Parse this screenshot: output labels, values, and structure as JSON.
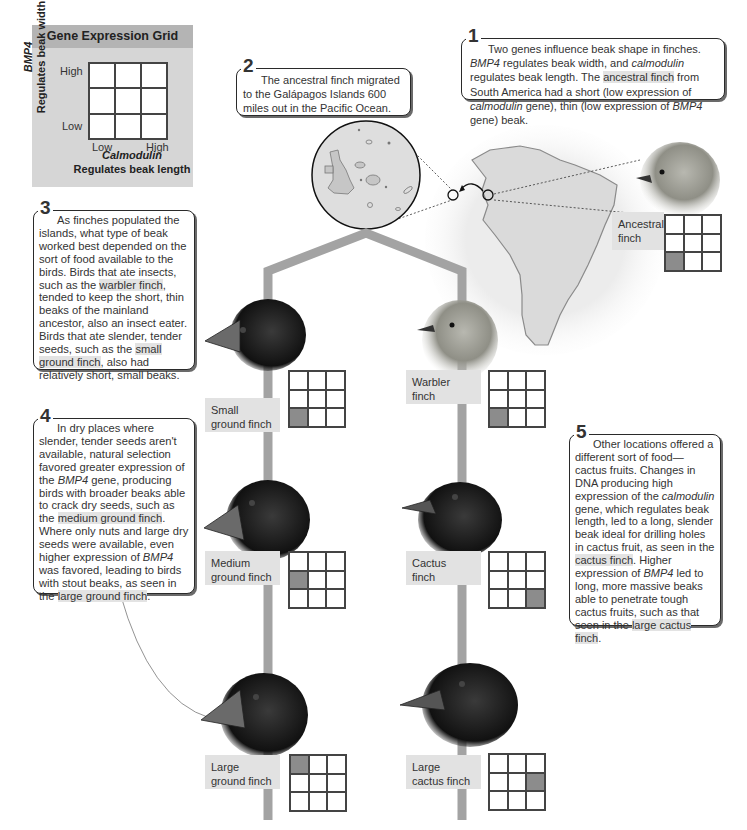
{
  "legend": {
    "title": "Gene Expression Grid",
    "y_gene": "BMP4",
    "y_desc": "Regulates beak width",
    "x_gene": "Calmodulin",
    "x_desc": "Regulates beak length",
    "y_high": "High",
    "y_low": "Low",
    "x_low": "Low",
    "x_high": "High"
  },
  "callouts": {
    "c1": {
      "num": "1",
      "t1": "Two genes influence beak shape in finches.",
      "t2a": "BMP4",
      "t2b": " regulates beak width, and ",
      "t2c": "calmodulin",
      "t2d": " regulates beak length. The ",
      "t2e": "ancestral finch",
      "t2f": " from South America had a short (low expression of ",
      "t2g": "calmodulin",
      "t2h": " gene), thin (low expression of ",
      "t2i": "BMP4",
      "t2j": " gene) beak."
    },
    "c2": {
      "num": "2",
      "text": "The ancestral finch migrated to the Galápagos Islands 600 miles out in the Pacific Ocean."
    },
    "c3": {
      "num": "3",
      "a": "As finches populated the islands, what type of beak worked best depended on the sort of food available to the birds. Birds that ate insects, such as the ",
      "b": "warbler finch",
      "c": ", tended to keep the short, thin beaks of the mainland ancestor, also an insect eater. Birds that ate slender, tender seeds, such as the ",
      "d": "small ground finch",
      "e": ", also had relatively short, small beaks."
    },
    "c4": {
      "num": "4",
      "a": "In dry places where slender, tender seeds aren't available, natural selection favored greater expression of the ",
      "b": "BMP4",
      "c": " gene, producing birds with broader beaks able to crack dry seeds, such as the ",
      "d": "medium ground finch",
      "e": ". Where only nuts and large dry seeds were available, even higher expression of ",
      "f": "BMP4",
      "g": " was favored, leading to birds with stout beaks, as seen in the ",
      "h": "large ground finch",
      "i": "."
    },
    "c5": {
      "num": "5",
      "a": "Other locations offered a different sort of food—cactus fruits. Changes in DNA producing high expression of the ",
      "b": "calmodulin",
      "c": " gene, which regulates beak length, led to a long, slender beak ideal for drilling holes in cactus fruit, as seen in the ",
      "d": "cactus finch",
      "e": ". Higher expression of ",
      "f": "BMP4",
      "g": " led to long, more massive beaks able to penetrate tough cactus fruits, such as that seen in the ",
      "h": "large cactus finch",
      "i": "."
    }
  },
  "species": [
    {
      "id": "ancestral",
      "label1": "Ancestral",
      "label2": "finch",
      "bmp4": "low",
      "calmodulin": "low",
      "cell": 6
    },
    {
      "id": "small-ground",
      "label1": "Small",
      "label2": "ground finch",
      "bmp4": "low",
      "calmodulin": "low",
      "cell": 6
    },
    {
      "id": "warbler",
      "label1": "Warbler",
      "label2": "finch",
      "bmp4": "low",
      "calmodulin": "low",
      "cell": 6
    },
    {
      "id": "medium-ground",
      "label1": "Medium",
      "label2": "ground finch",
      "bmp4": "medium",
      "calmodulin": "low",
      "cell": 3
    },
    {
      "id": "cactus",
      "label1": "Cactus",
      "label2": "finch",
      "bmp4": "low",
      "calmodulin": "high",
      "cell": 8
    },
    {
      "id": "large-ground",
      "label1": "Large",
      "label2": "ground finch",
      "bmp4": "high",
      "calmodulin": "low",
      "cell": 0
    },
    {
      "id": "large-cactus",
      "label1": "Large",
      "label2": "cactus finch",
      "bmp4": "medium",
      "calmodulin": "high",
      "cell": 5
    }
  ],
  "colors": {
    "branch": "#a3a3a3",
    "highlight": "#e3e3e3",
    "grid_on": "#8c8c8c",
    "legend_bg": "#d6d6d6",
    "legend_title_bg": "#b4b4b4"
  }
}
